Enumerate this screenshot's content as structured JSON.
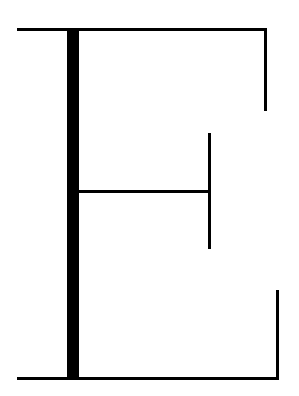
{
  "figure": {
    "letter": "E",
    "stroke_color": "#000000",
    "background_color": "#ffffff",
    "strokes": [
      {
        "id": "top-bar",
        "x": 17,
        "y": 28,
        "w": 250,
        "h": 3
      },
      {
        "id": "top-right-serif",
        "x": 264,
        "y": 28,
        "w": 3,
        "h": 83
      },
      {
        "id": "stem",
        "x": 67,
        "y": 28,
        "w": 12,
        "h": 352
      },
      {
        "id": "middle-bar",
        "x": 79,
        "y": 190,
        "w": 131,
        "h": 3
      },
      {
        "id": "middle-serif",
        "x": 208,
        "y": 133,
        "w": 3,
        "h": 116
      },
      {
        "id": "bottom-right-serif",
        "x": 276,
        "y": 290,
        "w": 3,
        "h": 90
      },
      {
        "id": "bottom-bar",
        "x": 17,
        "y": 377,
        "w": 262,
        "h": 3
      }
    ]
  }
}
